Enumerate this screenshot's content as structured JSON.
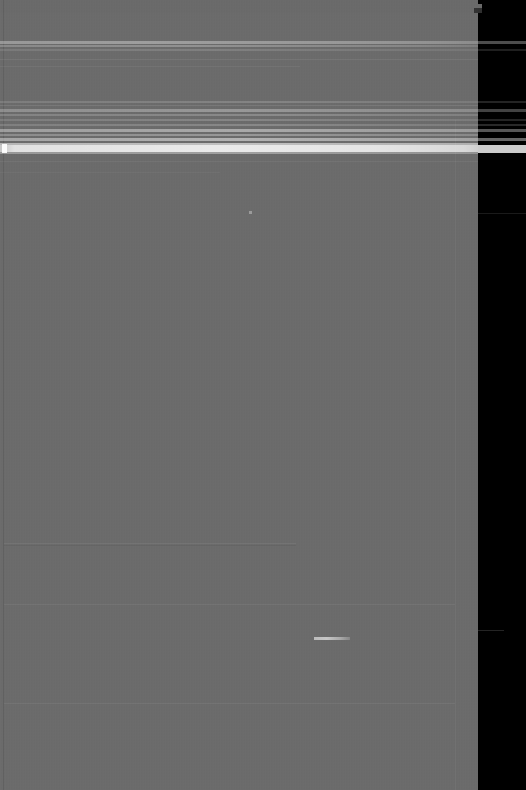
{
  "capture": {
    "width": 526,
    "height": 790,
    "legibility": "none",
    "description": "Severely horizontally motion-blurred screenshot of an application window. No text, icon or control is legible at any zoom level."
  },
  "colors": {
    "background": "#000000",
    "window_panel": "#6b6b6b",
    "window_panel_top": "#6a6a6a",
    "smear_highlight": "#ffffff",
    "separator": "rgba(255,255,255,0.055)"
  },
  "window": {
    "panel_left": 0,
    "panel_top": 12,
    "panel_width": 478,
    "panel_height": 778,
    "top_sliver_width": 482,
    "top_sliver_height": 13
  },
  "regions": {
    "chrome_band_upper": {
      "label": "upper smear band group",
      "y_start": 41,
      "y_end": 52
    },
    "chrome_band_lower": {
      "label": "dense smear band cluster",
      "y_start": 101,
      "y_end": 154
    },
    "content_area": {
      "label": "empty gray content field",
      "y_start": 160,
      "y_end": 790
    },
    "right_gutter": {
      "label": "black background right of window",
      "x_start": 478,
      "x_end": 526
    }
  },
  "smear_bands": [
    {
      "name": "band-a1",
      "top": 41,
      "height": 3,
      "intensity": 0.32
    },
    {
      "name": "band-a2",
      "top": 45,
      "height": 2,
      "intensity": 0.24
    },
    {
      "name": "band-a3",
      "top": 49,
      "height": 2,
      "intensity": 0.12
    },
    {
      "name": "wisp-b1",
      "top": 59,
      "height": 1,
      "intensity": 0.07
    },
    {
      "name": "wisp-b2",
      "top": 66,
      "height": 1,
      "intensity": 0.05
    },
    {
      "name": "band-c1",
      "top": 101,
      "height": 2,
      "intensity": 0.15
    },
    {
      "name": "band-c2",
      "top": 105,
      "height": 1,
      "intensity": 0.09
    },
    {
      "name": "band-c3",
      "top": 109,
      "height": 3,
      "intensity": 0.28
    },
    {
      "name": "band-c4",
      "top": 114,
      "height": 2,
      "intensity": 0.19
    },
    {
      "name": "band-c5",
      "top": 119,
      "height": 2,
      "intensity": 0.16
    },
    {
      "name": "band-c6",
      "top": 124,
      "height": 2,
      "intensity": 0.18
    },
    {
      "name": "band-d1",
      "top": 129,
      "height": 3,
      "intensity": 0.38
    },
    {
      "name": "band-d2",
      "top": 134,
      "height": 2,
      "intensity": 0.26
    },
    {
      "name": "band-d3",
      "top": 138,
      "height": 3,
      "intensity": 0.44
    },
    {
      "name": "band-e1",
      "top": 143,
      "height": 2,
      "intensity": 0.54
    },
    {
      "name": "band-e2",
      "top": 145,
      "height": 7,
      "intensity": 0.86
    },
    {
      "name": "band-e3",
      "top": 152,
      "height": 2,
      "intensity": 0.33
    },
    {
      "name": "wisp-f1",
      "top": 161,
      "height": 1,
      "intensity": 0.06
    },
    {
      "name": "wisp-f2",
      "top": 172,
      "height": 1,
      "intensity": 0.04
    }
  ],
  "separators": [
    {
      "name": "separator-1",
      "top": 543,
      "width": 292
    },
    {
      "name": "separator-2",
      "top": 604,
      "width": 451
    },
    {
      "name": "separator-3",
      "top": 703,
      "width": 451
    }
  ],
  "artifacts": [
    {
      "name": "bright-streak",
      "left": 314,
      "top": 637,
      "width": 36,
      "height": 3
    },
    {
      "name": "bright-dot",
      "left": 249,
      "top": 211,
      "width": 3,
      "height": 3
    },
    {
      "name": "band-end-nub",
      "left": 2,
      "top": 144,
      "width": 5,
      "height": 9
    }
  ],
  "text": {
    "legible_strings": [],
    "note": "No readable text present in the source image."
  }
}
